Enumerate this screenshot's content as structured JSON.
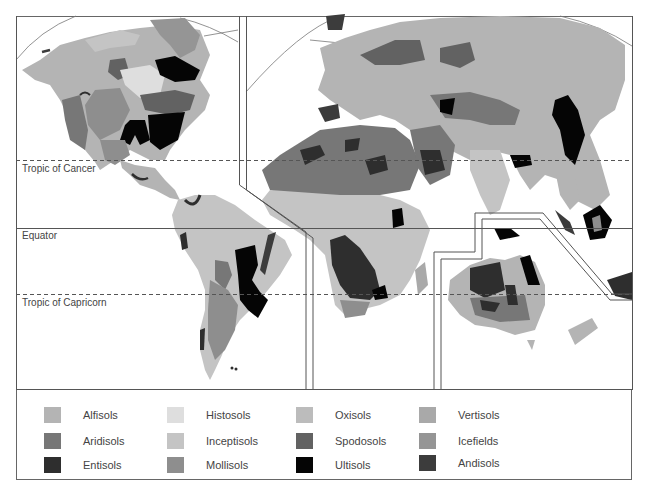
{
  "map": {
    "title": "World soil orders map",
    "reference_lines": [
      {
        "label": "Tropic of Cancer",
        "style": "dashed"
      },
      {
        "label": "Equator",
        "style": "solid"
      },
      {
        "label": "Tropic of Capricorn",
        "style": "dashed"
      }
    ],
    "panels": [
      "North America",
      "South America",
      "Europe, Asia and Africa",
      "Australia and Oceania"
    ]
  },
  "legend": {
    "items": [
      {
        "label": "Alfisols",
        "color": "#b4b4b4"
      },
      {
        "label": "Aridisols",
        "color": "#777777"
      },
      {
        "label": "Entisols",
        "color": "#2e2e2e"
      },
      {
        "label": "Histosols",
        "color": "#dedede"
      },
      {
        "label": "Inceptisols",
        "color": "#c4c4c4"
      },
      {
        "label": "Mollisols",
        "color": "#8e8e8e"
      },
      {
        "label": "Oxisols",
        "color": "#bcbcbc"
      },
      {
        "label": "Spodosols",
        "color": "#626262"
      },
      {
        "label": "Ultisols",
        "color": "#050505"
      },
      {
        "label": "Vertisols",
        "color": "#a9a9a9"
      },
      {
        "label": "Icefields",
        "color": "#959595"
      },
      {
        "label": "Andisols",
        "color": "#3c3c3c"
      }
    ]
  }
}
